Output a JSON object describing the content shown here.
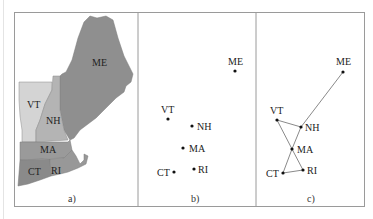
{
  "figure": {
    "panels": [
      {
        "id": "a",
        "caption": "a)",
        "kind": "map"
      },
      {
        "id": "b",
        "caption": "b)",
        "kind": "points"
      },
      {
        "id": "c",
        "caption": "c)",
        "kind": "graph"
      }
    ],
    "states": [
      "ME",
      "VT",
      "NH",
      "MA",
      "CT",
      "RI"
    ],
    "map_labels": {
      "ME": "ME",
      "VT": "VT",
      "NH": "NH",
      "MA": "MA",
      "CT": "CT",
      "RI": "RI"
    },
    "colors": {
      "ME": "#8f8f8f",
      "VT": "#d4d4d4",
      "NH": "#b4b4b4",
      "MA": "#9a9a9a",
      "CT": "#8a8a8a",
      "RI": "#989898",
      "border": "#9a9a9a",
      "edge": "#8a8a8a",
      "dot": "#111111"
    },
    "edges": [
      [
        "VT",
        "NH"
      ],
      [
        "VT",
        "MA"
      ],
      [
        "NH",
        "MA"
      ],
      [
        "NH",
        "ME"
      ],
      [
        "MA",
        "CT"
      ],
      [
        "MA",
        "RI"
      ],
      [
        "CT",
        "RI"
      ]
    ]
  }
}
